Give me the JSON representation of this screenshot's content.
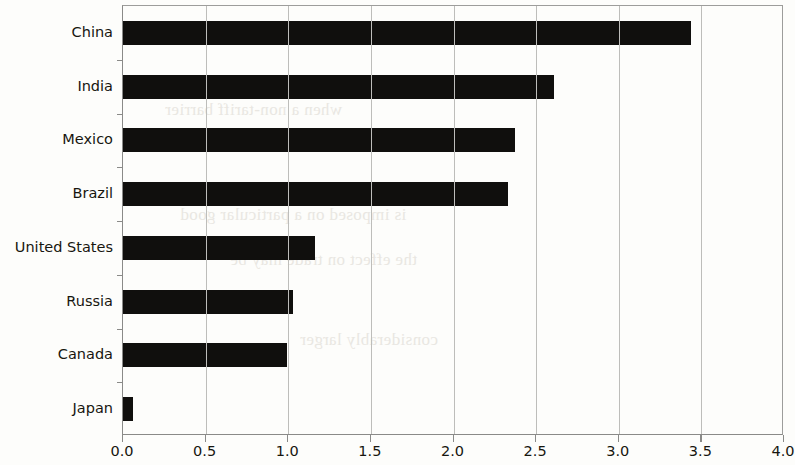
{
  "chart_data": {
    "type": "bar",
    "orientation": "horizontal",
    "title": "",
    "subtitle": "",
    "xlabel": "",
    "ylabel": "",
    "categories": [
      "China",
      "India",
      "Mexico",
      "Brazil",
      "United States",
      "Russia",
      "Canada",
      "Japan"
    ],
    "values": [
      3.44,
      2.61,
      2.37,
      2.33,
      1.16,
      1.03,
      0.99,
      0.06
    ],
    "series": [
      {
        "name": "",
        "values": [
          3.44,
          2.61,
          2.37,
          2.33,
          1.16,
          1.03,
          0.99,
          0.06
        ]
      }
    ],
    "xlim": [
      0.0,
      4.0
    ],
    "xticks": [
      0.0,
      0.5,
      1.0,
      1.5,
      2.0,
      2.5,
      3.0,
      3.5,
      4.0
    ],
    "xtick_labels": [
      "0.0",
      "0.5",
      "1.0",
      "1.5",
      "2.0",
      "2.5",
      "3.0",
      "3.5",
      "4.0"
    ],
    "grid": "vertical",
    "legend": "none",
    "bar_color": "#100f0d",
    "axis_color": "#8a8a88",
    "grid_color": "#bdbdba",
    "background_color": "#fdfdfb",
    "annotations": []
  },
  "page": {
    "bleed_text": [
      "when a non-tariff barrier",
      "is imposed on a particular good",
      "the effect on trade may be",
      "considerably larger"
    ]
  }
}
